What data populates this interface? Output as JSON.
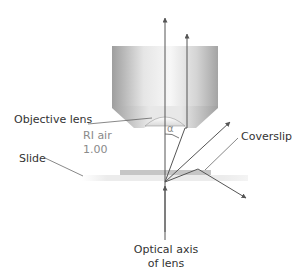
{
  "diagram": {
    "labels": {
      "objective_lens": "Objective lens",
      "ri_air_line1": "RI air",
      "ri_air_line2": "1.00",
      "slide": "Slide",
      "coverslip": "Coverslip",
      "alpha": "α",
      "optical_axis_line1": "Optical axis",
      "optical_axis_line2": "of lens"
    },
    "colors": {
      "text": "#333333",
      "muted_text": "#8a8a8a",
      "ray": "#555555",
      "slide": "#eeeeee",
      "coverslip": "#c8c8c8",
      "objective_light": "#f2f2f2",
      "objective_dark": "#a8a8a8"
    }
  }
}
